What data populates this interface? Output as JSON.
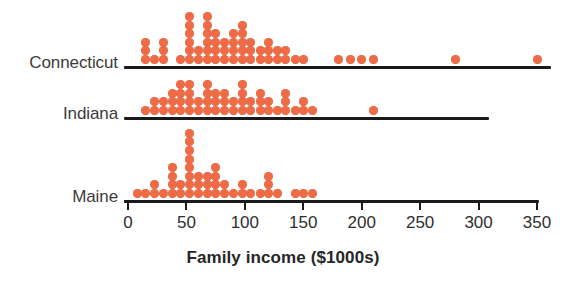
{
  "chart_data": {
    "type": "scatter",
    "plot_style": "stacked-dot-plot",
    "title": "",
    "xlabel": "Family income ($1000s)",
    "ylabel": "",
    "xlim": [
      -10,
      360
    ],
    "xticks": [
      0,
      50,
      100,
      150,
      200,
      250,
      300,
      350
    ],
    "xtick_labels": [
      "0",
      "50",
      "100",
      "150",
      "200",
      "250",
      "300",
      "350"
    ],
    "grid": false,
    "legend": "none",
    "dot_color": "#ee6b45",
    "axis_color": "#1a1a1a",
    "dot_unit": 1,
    "bin_width": 7.5,
    "groups": [
      {
        "label": "Connecticut",
        "bins": [
          {
            "x": 15,
            "count": 3
          },
          {
            "x": 23,
            "count": 1
          },
          {
            "x": 30,
            "count": 3
          },
          {
            "x": 45,
            "count": 1
          },
          {
            "x": 53,
            "count": 6
          },
          {
            "x": 60,
            "count": 2
          },
          {
            "x": 68,
            "count": 6
          },
          {
            "x": 75,
            "count": 4
          },
          {
            "x": 83,
            "count": 3
          },
          {
            "x": 90,
            "count": 4
          },
          {
            "x": 98,
            "count": 5
          },
          {
            "x": 105,
            "count": 3
          },
          {
            "x": 113,
            "count": 2
          },
          {
            "x": 120,
            "count": 3
          },
          {
            "x": 128,
            "count": 2
          },
          {
            "x": 135,
            "count": 2
          },
          {
            "x": 143,
            "count": 1
          },
          {
            "x": 150,
            "count": 1
          },
          {
            "x": 180,
            "count": 1
          },
          {
            "x": 190,
            "count": 1
          },
          {
            "x": 200,
            "count": 1
          },
          {
            "x": 210,
            "count": 1
          },
          {
            "x": 280,
            "count": 1
          },
          {
            "x": 350,
            "count": 1
          }
        ]
      },
      {
        "label": "Indiana",
        "bins": [
          {
            "x": 15,
            "count": 1
          },
          {
            "x": 23,
            "count": 2
          },
          {
            "x": 30,
            "count": 2
          },
          {
            "x": 38,
            "count": 3
          },
          {
            "x": 45,
            "count": 4
          },
          {
            "x": 53,
            "count": 4
          },
          {
            "x": 60,
            "count": 2
          },
          {
            "x": 68,
            "count": 4
          },
          {
            "x": 75,
            "count": 3
          },
          {
            "x": 83,
            "count": 3
          },
          {
            "x": 90,
            "count": 2
          },
          {
            "x": 98,
            "count": 4
          },
          {
            "x": 105,
            "count": 2
          },
          {
            "x": 113,
            "count": 3
          },
          {
            "x": 120,
            "count": 2
          },
          {
            "x": 128,
            "count": 1
          },
          {
            "x": 135,
            "count": 3
          },
          {
            "x": 143,
            "count": 1
          },
          {
            "x": 150,
            "count": 2
          },
          {
            "x": 158,
            "count": 1
          },
          {
            "x": 210,
            "count": 1
          }
        ]
      },
      {
        "label": "Maine",
        "bins": [
          {
            "x": 8,
            "count": 1
          },
          {
            "x": 15,
            "count": 1
          },
          {
            "x": 23,
            "count": 2
          },
          {
            "x": 30,
            "count": 1
          },
          {
            "x": 38,
            "count": 4
          },
          {
            "x": 45,
            "count": 2
          },
          {
            "x": 53,
            "count": 8
          },
          {
            "x": 60,
            "count": 3
          },
          {
            "x": 68,
            "count": 3
          },
          {
            "x": 75,
            "count": 4
          },
          {
            "x": 83,
            "count": 2
          },
          {
            "x": 90,
            "count": 1
          },
          {
            "x": 98,
            "count": 2
          },
          {
            "x": 105,
            "count": 1
          },
          {
            "x": 113,
            "count": 1
          },
          {
            "x": 120,
            "count": 3
          },
          {
            "x": 128,
            "count": 1
          },
          {
            "x": 143,
            "count": 1
          },
          {
            "x": 150,
            "count": 1
          },
          {
            "x": 158,
            "count": 1
          }
        ]
      }
    ]
  }
}
